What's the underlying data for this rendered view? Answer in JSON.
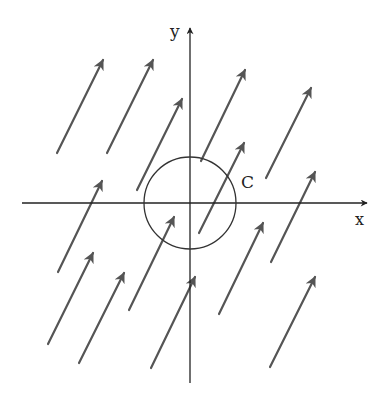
{
  "labels": {
    "x_axis": "x",
    "y_axis": "y",
    "curve": "C"
  },
  "colors": {
    "axis": "#222222",
    "arrow": "#555555",
    "circle": "#333333",
    "background": "#ffffff"
  },
  "axes": {
    "origin": [
      190,
      203
    ],
    "x_axis": {
      "from": [
        22,
        203
      ],
      "to": [
        367,
        203
      ]
    },
    "y_axis": {
      "from": [
        190,
        383
      ],
      "to": [
        190,
        28
      ]
    }
  },
  "circle": {
    "cx": 190,
    "cy": 203,
    "r": 46
  },
  "vector_field": {
    "description": "uniform constant vector field, arrows pointing up-right",
    "arrows": [
      {
        "x1": 57,
        "y1": 153,
        "x2": 103,
        "y2": 60
      },
      {
        "x1": 107,
        "y1": 153,
        "x2": 153,
        "y2": 60
      },
      {
        "x1": 137,
        "y1": 190,
        "x2": 182,
        "y2": 99
      },
      {
        "x1": 201,
        "y1": 161,
        "x2": 245,
        "y2": 70
      },
      {
        "x1": 199,
        "y1": 233,
        "x2": 244,
        "y2": 143
      },
      {
        "x1": 266,
        "y1": 178,
        "x2": 311,
        "y2": 88
      },
      {
        "x1": 271,
        "y1": 262,
        "x2": 315,
        "y2": 172
      },
      {
        "x1": 58,
        "y1": 272,
        "x2": 102,
        "y2": 181
      },
      {
        "x1": 48,
        "y1": 344,
        "x2": 93,
        "y2": 253
      },
      {
        "x1": 79,
        "y1": 363,
        "x2": 124,
        "y2": 273
      },
      {
        "x1": 129,
        "y1": 310,
        "x2": 174,
        "y2": 217
      },
      {
        "x1": 151,
        "y1": 368,
        "x2": 195,
        "y2": 277
      },
      {
        "x1": 219,
        "y1": 314,
        "x2": 263,
        "y2": 223
      },
      {
        "x1": 270,
        "y1": 367,
        "x2": 315,
        "y2": 277
      }
    ]
  }
}
